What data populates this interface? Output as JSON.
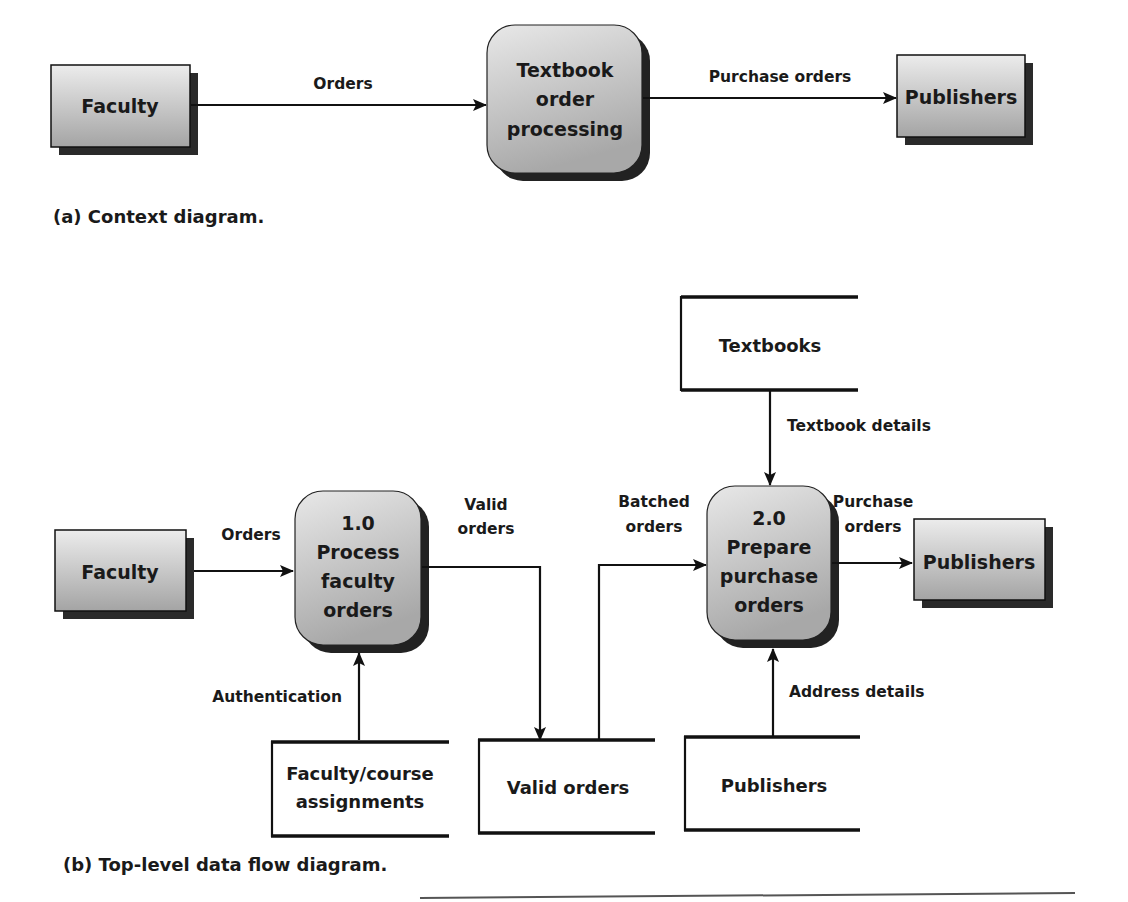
{
  "context_diagram": {
    "caption": "(a) Context diagram.",
    "entities": [
      {
        "id": "faculty",
        "label": "Faculty"
      },
      {
        "id": "publishers",
        "label": "Publishers"
      }
    ],
    "process": {
      "id": "textbook-order-processing",
      "lines": [
        "Textbook",
        "order",
        "processing"
      ]
    },
    "flows": [
      {
        "from": "faculty",
        "to": "textbook-order-processing",
        "label": "Orders"
      },
      {
        "from": "textbook-order-processing",
        "to": "publishers",
        "label": "Purchase orders"
      }
    ]
  },
  "top_level_dfd": {
    "caption": "(b) Top-level data flow diagram.",
    "entities": [
      {
        "id": "faculty",
        "label": "Faculty"
      },
      {
        "id": "publishers",
        "label": "Publishers"
      }
    ],
    "processes": [
      {
        "id": "p1",
        "lines": [
          "1.0",
          "Process",
          "faculty",
          "orders"
        ]
      },
      {
        "id": "p2",
        "lines": [
          "2.0",
          "Prepare",
          "purchase",
          "orders"
        ]
      }
    ],
    "stores": [
      {
        "id": "textbooks",
        "lines": [
          "Textbooks"
        ]
      },
      {
        "id": "faculty-course",
        "lines": [
          "Faculty/course",
          "assignments"
        ]
      },
      {
        "id": "valid-orders",
        "lines": [
          "Valid orders"
        ]
      },
      {
        "id": "publishers-store",
        "lines": [
          "Publishers"
        ]
      }
    ],
    "flows": [
      {
        "from": "faculty",
        "to": "p1",
        "lines": [
          "Orders"
        ]
      },
      {
        "from": "p1",
        "to": "valid-orders",
        "lines": [
          "Valid",
          "orders"
        ]
      },
      {
        "from": "valid-orders",
        "to": "p2",
        "lines": [
          "Batched",
          "orders"
        ]
      },
      {
        "from": "p2",
        "to": "publishers",
        "lines": [
          "Purchase",
          "orders"
        ]
      },
      {
        "from": "textbooks",
        "to": "p2",
        "lines": [
          "Textbook details"
        ]
      },
      {
        "from": "faculty-course",
        "to": "p1",
        "lines": [
          "Authentication"
        ]
      },
      {
        "from": "publishers-store",
        "to": "p2",
        "lines": [
          "Address details"
        ]
      }
    ]
  },
  "colors": {
    "entity_fill_top": "#ececec",
    "entity_fill_bottom": "#a9a9a9",
    "shadow": "#222222",
    "line": "#111111"
  }
}
